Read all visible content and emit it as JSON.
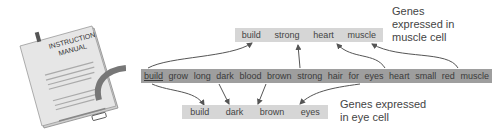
{
  "manual": {
    "title_line1": "INSTRUCTION",
    "title_line2": "MANUAL"
  },
  "genome": {
    "words": [
      "build",
      "grow",
      "long",
      "dark",
      "blood",
      "brown",
      "strong",
      "hair",
      "for",
      "eyes",
      "heart",
      "small",
      "red",
      "muscle"
    ]
  },
  "muscle_cell": {
    "genes": [
      "build",
      "strong",
      "heart",
      "muscle"
    ],
    "label": "Genes expressed in muscle cell",
    "label_line1": "Genes",
    "label_line2": "expressed in",
    "label_line3": "muscle cell"
  },
  "eye_cell": {
    "genes": [
      "build",
      "dark",
      "brown",
      "eyes"
    ],
    "label_line1": "Genes expressed",
    "label_line2": "in eye cell"
  },
  "colors": {
    "genome_bar": "#9e9e9e",
    "expressed_bar": "#d6d6d6",
    "arrow": "#555555"
  }
}
